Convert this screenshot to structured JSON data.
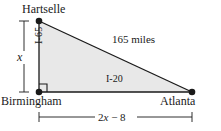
{
  "figure": {
    "background_color": "#ffffff",
    "line_color": "#1a1a1a",
    "triangle_fill_color": "#e8e8e8",
    "vertices": {
      "hartselle": {
        "label": "Hartselle",
        "x": 39,
        "y": 21
      },
      "birmingham": {
        "label": "Birmingham",
        "x": 39,
        "y": 92
      },
      "atlanta": {
        "label": "Atlanta",
        "x": 192,
        "y": 92
      }
    },
    "edges": {
      "vertical_leg": {
        "label": "I-65",
        "from": "hartselle",
        "to": "birmingham"
      },
      "horizontal_leg": {
        "label": "I-20",
        "from": "birmingham",
        "to": "atlanta"
      },
      "hypotenuse": {
        "label": "165 miles",
        "from": "hartselle",
        "to": "atlanta"
      }
    },
    "dimensions": {
      "vertical": {
        "label": "x",
        "italic": true,
        "from_y": 21,
        "to_y": 92,
        "x": 24
      },
      "horizontal": {
        "label_prefix": "2",
        "label_var": "x",
        "label_suffix": " − 8",
        "full": "2x − 8",
        "y": 117,
        "from_x": 39,
        "to_x": 192
      }
    },
    "right_angle_marker": {
      "at": "birmingham",
      "size": 8
    }
  }
}
